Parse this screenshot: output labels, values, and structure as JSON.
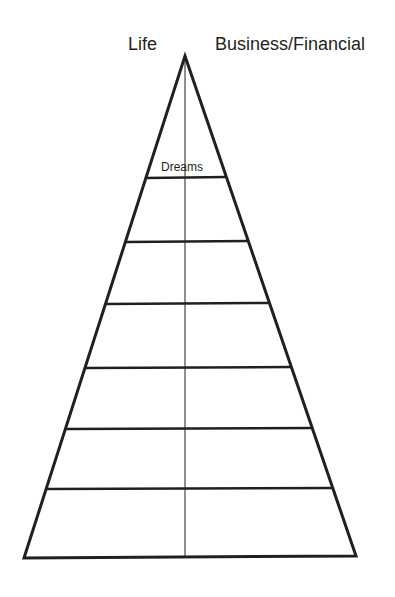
{
  "diagram": {
    "title_left": "Life",
    "title_right": "Business/Financial",
    "levels": [
      {
        "label": "Dreams"
      },
      {
        "label": ""
      },
      {
        "label": ""
      },
      {
        "label": ""
      },
      {
        "label": ""
      },
      {
        "label": ""
      },
      {
        "label": ""
      }
    ],
    "line_color": "#231f20"
  }
}
